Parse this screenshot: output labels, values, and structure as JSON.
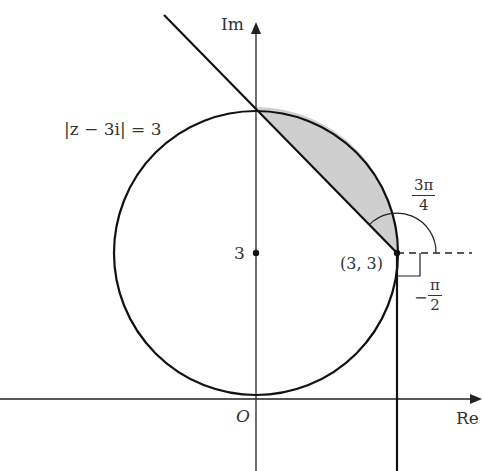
{
  "diagram": {
    "axes": {
      "x_label": "Re",
      "y_label": "Im",
      "origin_label": "O"
    },
    "circle": {
      "equation_label": "|z − 3i| = 3",
      "center": [
        0,
        3
      ],
      "radius": 3
    },
    "y_tick_label": "3",
    "point": {
      "label": "(3, 3)"
    },
    "angles": [
      {
        "numerator": "3π",
        "denominator": "4",
        "sign": ""
      },
      {
        "numerator": "π",
        "denominator": "2",
        "sign": "−"
      }
    ],
    "colors": {
      "line": "#111111",
      "shade": "#cccccc",
      "text": "#333333"
    }
  }
}
